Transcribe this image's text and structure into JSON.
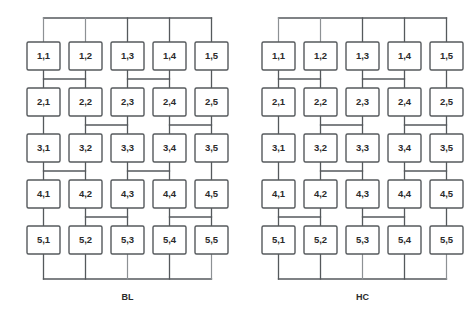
{
  "figure": {
    "type": "diagram",
    "background_color": "#ffffff",
    "line_color": "#55595c",
    "text_color": "#2b2b2b"
  },
  "panels": [
    {
      "id": "bl",
      "caption": "BL",
      "origin_x": 27,
      "node_labels": [
        [
          "1,1",
          "1,2",
          "1,3",
          "1,4",
          "1,5"
        ],
        [
          "2,1",
          "2,2",
          "2,3",
          "2,4",
          "2,5"
        ],
        [
          "3,1",
          "3,2",
          "3,3",
          "3,4",
          "3,5"
        ],
        [
          "4,1",
          "4,2",
          "4,3",
          "4,4",
          "4,5"
        ],
        [
          "5,1",
          "5,2",
          "5,3",
          "5,4",
          "5,5"
        ]
      ],
      "top_bus": {
        "present": true,
        "columns": [
          1,
          2,
          3,
          4,
          5
        ]
      },
      "bottom_bus": {
        "present": true,
        "columns": [
          1,
          2,
          3,
          4,
          5
        ]
      },
      "interconnects": [
        {
          "between_rows": "1-2",
          "groups": [
            [
              1,
              2
            ],
            [
              3,
              4
            ],
            [
              5
            ]
          ]
        },
        {
          "between_rows": "2-3",
          "groups": [
            [
              1
            ],
            [
              2,
              3
            ],
            [
              4,
              5
            ]
          ]
        },
        {
          "between_rows": "3-4",
          "groups": [
            [
              1,
              2
            ],
            [
              3,
              4
            ],
            [
              5
            ]
          ]
        },
        {
          "between_rows": "4-5",
          "groups": [
            [
              1
            ],
            [
              2,
              3
            ],
            [
              4,
              5
            ]
          ]
        }
      ]
    },
    {
      "id": "hc",
      "caption": "HC",
      "origin_x": 262,
      "node_labels": [
        [
          "1,1",
          "1,2",
          "1,3",
          "1,4",
          "1,5"
        ],
        [
          "2,1",
          "2,2",
          "2,3",
          "2,4",
          "2,5"
        ],
        [
          "3,1",
          "3,2",
          "3,3",
          "3,4",
          "3,5"
        ],
        [
          "4,1",
          "4,2",
          "4,3",
          "4,4",
          "4,5"
        ],
        [
          "5,1",
          "5,2",
          "5,3",
          "5,4",
          "5,5"
        ]
      ],
      "top_bus": {
        "present": true,
        "columns": [
          1,
          2,
          3,
          4,
          5
        ]
      },
      "bottom_bus": {
        "present": true,
        "columns": [
          1,
          2,
          3,
          4,
          5
        ]
      },
      "interconnects": [
        {
          "between_rows": "1-2",
          "groups": [
            [
              1,
              2
            ],
            [
              3,
              4
            ],
            [
              5
            ]
          ]
        },
        {
          "between_rows": "2-3",
          "groups": [
            [
              1
            ],
            [
              2,
              3
            ],
            [
              4,
              5
            ]
          ]
        },
        {
          "between_rows": "3-4",
          "groups": [
            [
              1
            ],
            [
              2,
              3
            ],
            [
              4,
              5
            ]
          ]
        },
        {
          "between_rows": "4-5",
          "groups": [
            [
              1,
              2
            ],
            [
              3,
              4
            ],
            [
              5
            ]
          ]
        }
      ]
    }
  ],
  "geometry": {
    "box_width": 33,
    "box_height": 28,
    "col_pitch": 42,
    "row_pitch": 46,
    "first_row_y": 42,
    "top_bus_y": 18,
    "bottom_bus_y": 279,
    "caption_y": 300
  }
}
